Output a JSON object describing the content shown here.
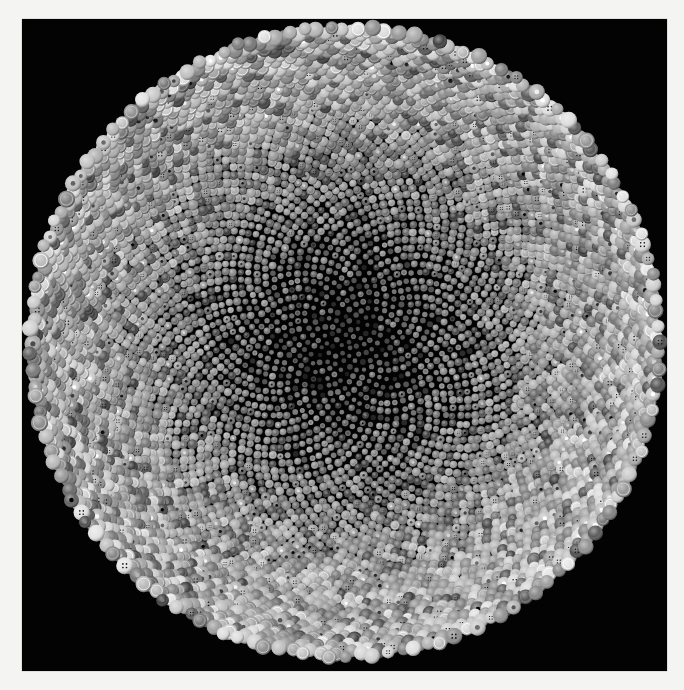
{
  "artwork": {
    "description": "Circular mosaic of thousands of grayscale buttons arranged on a black square panel inside a white frame",
    "palette": {
      "frame": "#f4f4f2",
      "panel": "#030303",
      "gray_min": 40,
      "gray_max": 225
    },
    "panel": {
      "x": 22,
      "y": 19,
      "width": 645,
      "height": 652
    },
    "mosaic": {
      "center_x": 323,
      "center_y": 323,
      "radius": 316,
      "count": 5200,
      "edge_button_diameter": 15,
      "center_button_diameter": 5,
      "seed": 7
    },
    "visible_glyphs": [
      "A",
      "9",
      "M",
      "OM",
      "smiley",
      "peace-sign",
      "star"
    ]
  }
}
